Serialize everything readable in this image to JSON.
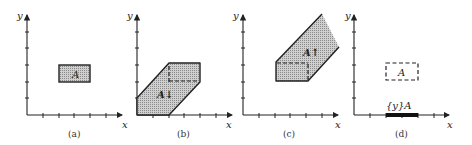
{
  "figure": {
    "panels": [
      {
        "id": "a",
        "caption": "(a)",
        "x_axis_label": "x",
        "y_axis_label": "y",
        "region_label": "A",
        "description": "Rectangle region A"
      },
      {
        "id": "b",
        "caption": "(b)",
        "x_axis_label": "x",
        "y_axis_label": "y",
        "region_label": "A↓",
        "description": "Downward extension of A"
      },
      {
        "id": "c",
        "caption": "(c)",
        "x_axis_label": "x",
        "y_axis_label": "y",
        "region_label": "A↑",
        "description": "Upward extension of A"
      },
      {
        "id": "d",
        "caption": "(d)",
        "x_axis_label": "x",
        "y_axis_label": "y",
        "region_label": "A",
        "projection_label": "{y}A",
        "description": "Projection of A onto x-axis"
      }
    ],
    "colors": {
      "ink": "#222222",
      "fill": "#bdbdbd"
    }
  }
}
